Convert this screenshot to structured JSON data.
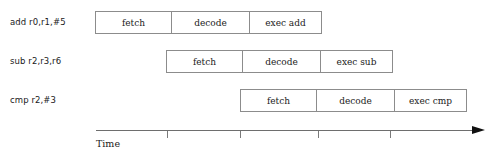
{
  "diagram": {
    "axis": {
      "label": "Time",
      "tick_positions": [
        167,
        240,
        318,
        390
      ],
      "start_x": 96,
      "end_x": 485,
      "arrow": "right-arrow-icon"
    },
    "colors": {
      "box_border": "#8c8c8c",
      "text": "#1a1a1a",
      "axis": "#6e6e6e",
      "arrow": "#111111",
      "background": "#ffffff"
    },
    "rows": [
      {
        "label": "add r0,r1,#5",
        "label_x": 10,
        "label_y": 17,
        "start_x": 95,
        "top": 11,
        "stages": [
          {
            "name": "fetch",
            "width": 76
          },
          {
            "name": "decode",
            "width": 78
          },
          {
            "name": "exec add",
            "width": 73
          }
        ]
      },
      {
        "label": "sub r2,r3,r6",
        "label_x": 10,
        "label_y": 56,
        "start_x": 166,
        "top": 50,
        "stages": [
          {
            "name": "fetch",
            "width": 76
          },
          {
            "name": "decode",
            "width": 78
          },
          {
            "name": "exec sub",
            "width": 73
          }
        ]
      },
      {
        "label": "cmp r2,#3",
        "label_x": 10,
        "label_y": 95,
        "start_x": 240,
        "top": 89,
        "stages": [
          {
            "name": "fetch",
            "width": 76
          },
          {
            "name": "decode",
            "width": 78
          },
          {
            "name": "exec cmp",
            "width": 73
          }
        ]
      }
    ]
  }
}
